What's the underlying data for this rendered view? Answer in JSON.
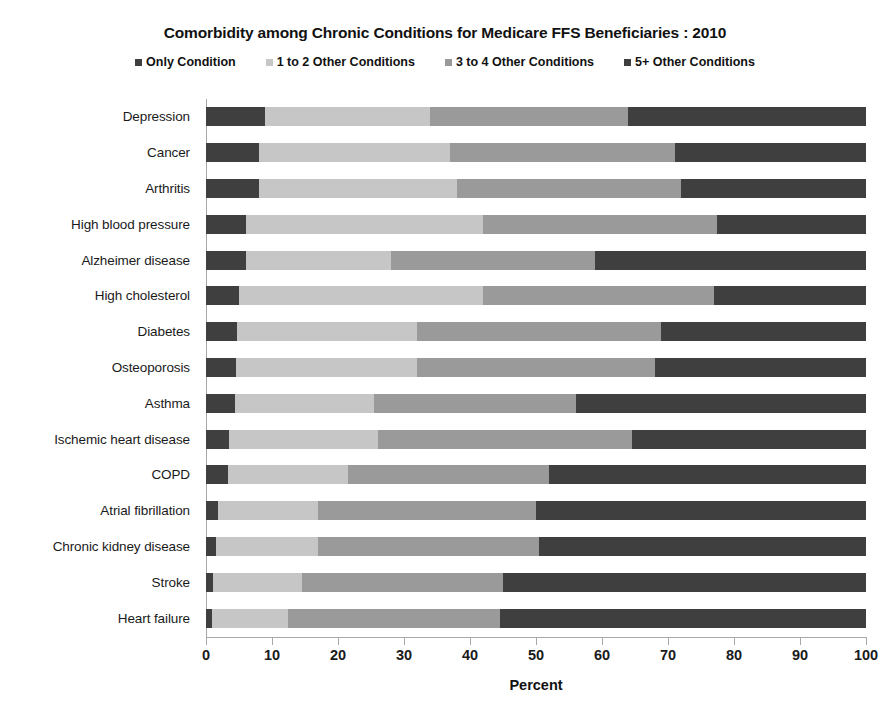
{
  "chart_data": {
    "type": "bar",
    "orientation": "horizontal",
    "stacked": true,
    "stack_mode": "percent",
    "title": "Comorbidity among Chronic Conditions for Medicare FFS Beneficiaries : 2010",
    "xlabel": "Percent",
    "ylabel": "",
    "xlim": [
      0,
      100
    ],
    "xticks": [
      0,
      10,
      20,
      30,
      40,
      50,
      60,
      70,
      80,
      90,
      100
    ],
    "grid": false,
    "legend_position": "top",
    "categories": [
      "Depression",
      "Cancer",
      "Arthritis",
      "High blood pressure",
      "Alzheimer disease",
      "High cholesterol",
      "Diabetes",
      "Osteoporosis",
      "Asthma",
      "Ischemic heart disease",
      "COPD",
      "Atrial fibrillation",
      "Chronic kidney disease",
      "Stroke",
      "Heart failure"
    ],
    "series": [
      {
        "name": "Only Condition",
        "color": "#3f3f3f",
        "values": [
          9.0,
          8.0,
          8.0,
          6.0,
          6.0,
          5.0,
          4.7,
          4.5,
          4.4,
          3.5,
          3.3,
          1.8,
          1.5,
          1.0,
          0.9
        ]
      },
      {
        "name": "1 to 2 Other Conditions",
        "color": "#c6c6c6",
        "values": [
          25.0,
          29.0,
          30.0,
          36.0,
          22.0,
          37.0,
          27.3,
          27.5,
          21.1,
          22.5,
          18.2,
          15.2,
          15.5,
          13.5,
          11.6
        ]
      },
      {
        "name": "3 to 4 Other Conditions",
        "color": "#9a9a9a",
        "values": [
          30.0,
          34.0,
          34.0,
          35.5,
          31.0,
          35.0,
          37.0,
          36.0,
          30.5,
          38.5,
          30.5,
          33.0,
          33.5,
          30.5,
          32.0
        ]
      },
      {
        "name": "5+ Other Conditions",
        "color": "#3f3f3f",
        "values": [
          36.0,
          29.0,
          28.0,
          22.5,
          41.0,
          23.0,
          31.0,
          32.0,
          44.0,
          35.5,
          48.0,
          50.0,
          49.5,
          55.0,
          55.5
        ]
      }
    ]
  }
}
